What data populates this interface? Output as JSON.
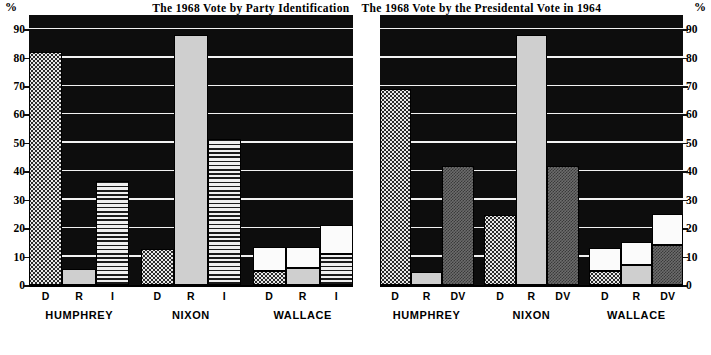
{
  "chart_data": [
    {
      "type": "bar",
      "title": "The 1968 Vote by Party Identification",
      "axis_unit_label": "%",
      "ylabel": "",
      "xlabel": "",
      "ylim": [
        0,
        95
      ],
      "yticks": [
        0,
        10,
        20,
        30,
        40,
        50,
        60,
        70,
        80,
        90
      ],
      "grid": true,
      "y_axis_side": "left",
      "groups": [
        "HUMPHREY",
        "NIXON",
        "WALLACE"
      ],
      "categories": [
        "D",
        "R",
        "I"
      ],
      "stacked": true,
      "series": [
        {
          "name": "patterned-base",
          "values": [
            82,
            5.5,
            36.5,
            12.5,
            88,
            51.5,
            5,
            6,
            11
          ]
        },
        {
          "name": "white-top",
          "values": [
            0,
            0,
            0,
            0,
            0,
            0,
            8.5,
            7.5,
            10
          ]
        }
      ],
      "bars": [
        {
          "group": "HUMPHREY",
          "category": "D",
          "fill": "dot",
          "base": 82,
          "top": 0,
          "total": 82
        },
        {
          "group": "HUMPHREY",
          "category": "R",
          "fill": "gray",
          "base": 5.5,
          "top": 0,
          "total": 5.5
        },
        {
          "group": "HUMPHREY",
          "category": "I",
          "fill": "wave",
          "base": 36.5,
          "top": 0,
          "total": 36.5
        },
        {
          "group": "NIXON",
          "category": "D",
          "fill": "dot",
          "base": 12.5,
          "top": 0,
          "total": 12.5
        },
        {
          "group": "NIXON",
          "category": "R",
          "fill": "gray",
          "base": 88,
          "top": 0,
          "total": 88
        },
        {
          "group": "NIXON",
          "category": "I",
          "fill": "wave",
          "base": 51.5,
          "top": 0,
          "total": 51.5
        },
        {
          "group": "WALLACE",
          "category": "D",
          "fill": "dot",
          "base": 5,
          "top": 8.5,
          "total": 13.5
        },
        {
          "group": "WALLACE",
          "category": "R",
          "fill": "gray",
          "base": 6,
          "top": 7.5,
          "total": 13.5
        },
        {
          "group": "WALLACE",
          "category": "I",
          "fill": "wave",
          "base": 11,
          "top": 10,
          "total": 21
        }
      ]
    },
    {
      "type": "bar",
      "title": "The 1968 Vote by the Presidental Vote in 1964",
      "axis_unit_label": "%",
      "ylabel": "",
      "xlabel": "",
      "ylim": [
        0,
        95
      ],
      "yticks": [
        0,
        10,
        20,
        30,
        40,
        50,
        60,
        70,
        80,
        90
      ],
      "grid": true,
      "y_axis_side": "right",
      "groups": [
        "HUMPHREY",
        "NIXON",
        "WALLACE"
      ],
      "categories": [
        "D",
        "R",
        "DV"
      ],
      "stacked": true,
      "series": [
        {
          "name": "patterned-base",
          "values": [
            69,
            4.5,
            42,
            24.5,
            88,
            42,
            5,
            7,
            14
          ]
        },
        {
          "name": "white-top",
          "values": [
            0,
            0,
            0,
            0,
            0,
            0,
            8,
            8,
            11
          ]
        }
      ],
      "bars": [
        {
          "group": "HUMPHREY",
          "category": "D",
          "fill": "dot",
          "base": 69,
          "top": 0,
          "total": 69
        },
        {
          "group": "HUMPHREY",
          "category": "R",
          "fill": "gray",
          "base": 4.5,
          "top": 0,
          "total": 4.5
        },
        {
          "group": "HUMPHREY",
          "category": "DV",
          "fill": "check",
          "base": 42,
          "top": 0,
          "total": 42
        },
        {
          "group": "NIXON",
          "category": "D",
          "fill": "dot",
          "base": 24.5,
          "top": 0,
          "total": 24.5
        },
        {
          "group": "NIXON",
          "category": "R",
          "fill": "gray",
          "base": 88,
          "top": 0,
          "total": 88
        },
        {
          "group": "NIXON",
          "category": "DV",
          "fill": "check",
          "base": 42,
          "top": 0,
          "total": 42
        },
        {
          "group": "WALLACE",
          "category": "D",
          "fill": "dot",
          "base": 5,
          "top": 8,
          "total": 13
        },
        {
          "group": "WALLACE",
          "category": "R",
          "fill": "gray",
          "base": 7,
          "top": 8,
          "total": 15
        },
        {
          "group": "WALLACE",
          "category": "DV",
          "fill": "check",
          "base": 14,
          "top": 11,
          "total": 25
        }
      ]
    }
  ]
}
